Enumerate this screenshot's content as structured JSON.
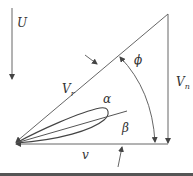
{
  "diagram": {
    "labels": {
      "U": "U",
      "Vr": "V",
      "Vr_sub": "r",
      "Vn": "V",
      "Vn_sub": "n",
      "v": "v",
      "alpha": "α",
      "beta": "β",
      "phi": "ϕ"
    },
    "colors": {
      "line": "#555555",
      "text": "#333333",
      "background": "#ffffff",
      "bottom_bar": "#555555"
    }
  }
}
